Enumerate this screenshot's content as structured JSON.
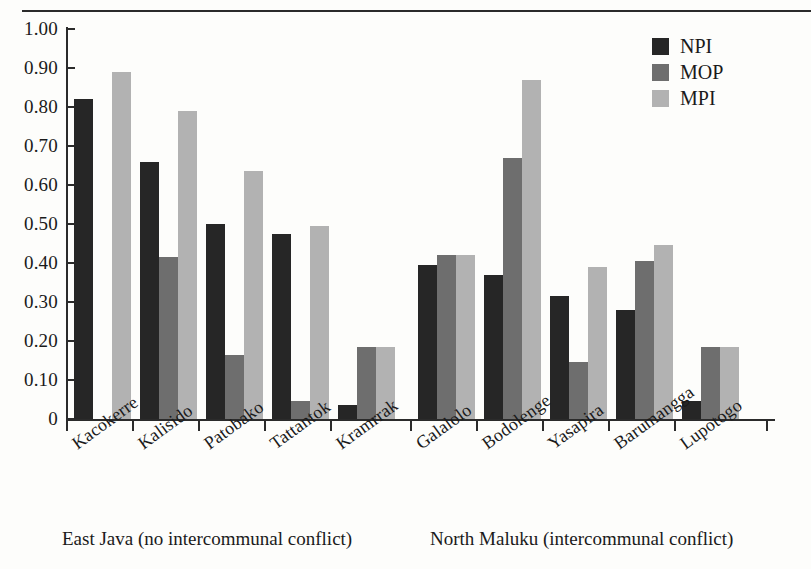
{
  "chart_data": {
    "type": "bar",
    "title": "",
    "xlabel": "",
    "ylabel": "",
    "ylim": [
      0,
      1.0
    ],
    "grid": false,
    "legend_position": "top-right",
    "categories": [
      "Kacokerre",
      "Kalisido",
      "Patobako",
      "Tattantok",
      "Kramrrak",
      "Galalolo",
      "Bodolenge",
      "Yasapira",
      "Barumangga",
      "Lupotogo"
    ],
    "y_ticks": [
      "0",
      "0.10",
      "0.20",
      "0.30",
      "0.40",
      "0.50",
      "0.60",
      "0.70",
      "0.80",
      "0.90",
      "1.00"
    ],
    "y_tick_values": [
      0,
      0.1,
      0.2,
      0.3,
      0.4,
      0.5,
      0.6,
      0.7,
      0.8,
      0.9,
      1.0
    ],
    "series": [
      {
        "name": "NPI",
        "color": "#262626",
        "values": [
          0.82,
          0.66,
          0.5,
          0.475,
          0.035,
          0.395,
          0.37,
          0.315,
          0.28,
          0.045
        ]
      },
      {
        "name": "MOP",
        "color": "#6e6e6e",
        "values": [
          0,
          0.415,
          0.165,
          0.045,
          0.185,
          0.42,
          0.67,
          0.145,
          0.405,
          0.185
        ]
      },
      {
        "name": "MPI",
        "color": "#b2b2b2",
        "values": [
          0.89,
          0.79,
          0.635,
          0.495,
          0.185,
          0.42,
          0.87,
          0.39,
          0.445,
          0.185
        ]
      }
    ],
    "group_captions": [
      {
        "text": "East Java (no intercommunal conflict)",
        "categories": [
          "Kacokerre",
          "Kalisido",
          "Patobako",
          "Tattantok",
          "Kramrrak"
        ]
      },
      {
        "text": "North Maluku (intercommunal conflict)",
        "categories": [
          "Galalolo",
          "Bodolenge",
          "Yasapira",
          "Barumangga",
          "Lupotogo"
        ]
      }
    ]
  },
  "legend": {
    "items": [
      {
        "label": "NPI",
        "color": "#262626"
      },
      {
        "label": "MOP",
        "color": "#6e6e6e"
      },
      {
        "label": "MPI",
        "color": "#b2b2b2"
      }
    ]
  },
  "captions": {
    "left": "East Java (no intercommunal conflict)",
    "right": "North Maluku (intercommunal conflict)"
  }
}
